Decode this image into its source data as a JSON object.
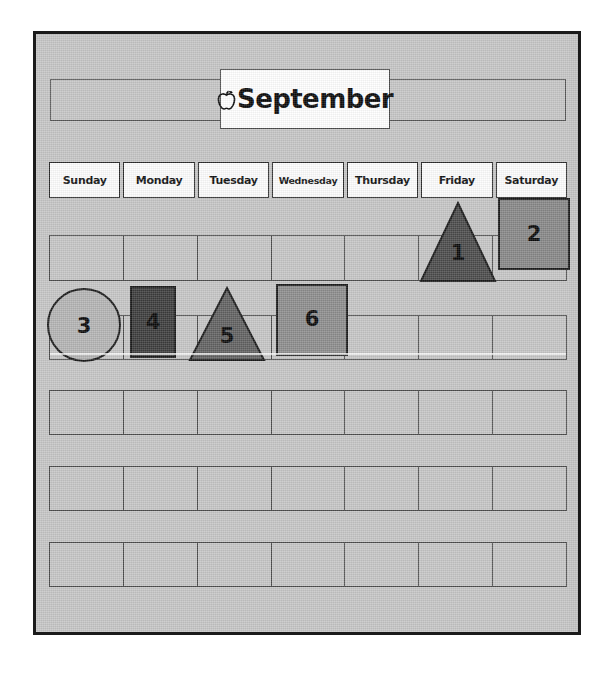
{
  "page": {
    "title": "September",
    "title_icon": "apple-icon",
    "background_color": "#c6c6c6",
    "border_color": "#1b1b1b"
  },
  "weekdays": [
    {
      "label": "Sunday"
    },
    {
      "label": "Monday"
    },
    {
      "label": "Tuesday"
    },
    {
      "label": "Wednesday"
    },
    {
      "label": "Thursday"
    },
    {
      "label": "Friday"
    },
    {
      "label": "Saturday"
    }
  ],
  "weeks": [
    {
      "name": "week-1",
      "cells": [
        "",
        "",
        "",
        "",
        "",
        "1",
        "2"
      ]
    },
    {
      "name": "week-2",
      "cells": [
        "3",
        "4",
        "5",
        "6",
        "",
        "",
        ""
      ]
    },
    {
      "name": "week-3",
      "cells": [
        "",
        "",
        "",
        "",
        "",
        "",
        ""
      ]
    },
    {
      "name": "week-4",
      "cells": [
        "",
        "",
        "",
        "",
        "",
        "",
        ""
      ]
    },
    {
      "name": "week-5",
      "cells": [
        "",
        "",
        "",
        "",
        "",
        "",
        ""
      ]
    }
  ],
  "day_shapes": [
    {
      "number": "1",
      "shape": "triangle",
      "weekday": "Friday",
      "week": 1,
      "fill_color": "#4a4a4a",
      "outline_color": "#1a1a1a"
    },
    {
      "number": "2",
      "shape": "square",
      "weekday": "Saturday",
      "week": 1,
      "fill_color": "#878787",
      "outline_color": "#1a1a1a"
    },
    {
      "number": "3",
      "shape": "circle",
      "weekday": "Sunday",
      "week": 2,
      "fill_color": "#b4b4b4",
      "outline_color": "#1a1a1a"
    },
    {
      "number": "4",
      "shape": "rectangle",
      "weekday": "Monday",
      "week": 2,
      "fill_color": "#3c3c3c",
      "outline_color": "#1a1a1a"
    },
    {
      "number": "5",
      "shape": "triangle",
      "weekday": "Tuesday",
      "week": 2,
      "fill_color": "#616161",
      "outline_color": "#1a1a1a"
    },
    {
      "number": "6",
      "shape": "square",
      "weekday": "Wednesday",
      "week": 2,
      "fill_color": "#8c8c8c",
      "outline_color": "#1a1a1a"
    }
  ]
}
